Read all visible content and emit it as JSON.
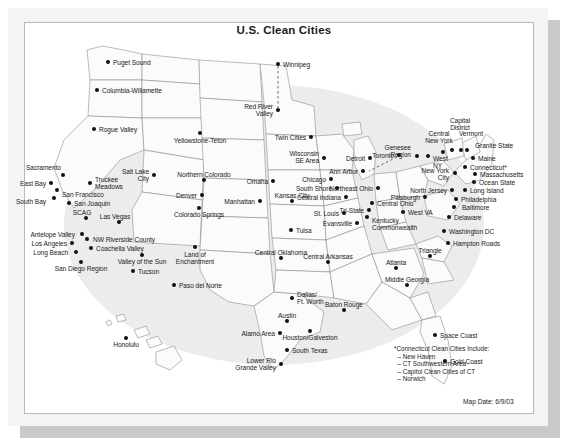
{
  "page": {
    "title": "U.S. Clean Cities",
    "map_date": "Map Date: 6/9/03",
    "footnote": "*Connecticut Clean Cities Include:\n  – New Haven\n  – CT Southwestern Area\n  – Capitol Clean Cities of CT\n  – Norwich",
    "colors": {
      "ink": "#1a1a1a",
      "marker": "#111111",
      "state_fill": "#fbfbfb",
      "state_stroke": "#8d8d8d",
      "halo": "#ececec",
      "frame": "#f4f4f4",
      "frame_shadow": "#c9c9c9"
    }
  },
  "map": {
    "type": "point-map",
    "region": "United States (lower 48 + Hawaii) with Canadian cities",
    "marker_shape": "filled-circle",
    "connector_style": "dashed-line",
    "cities": [
      {
        "name": "Puget Sound",
        "x": 84,
        "y": 22,
        "dx": 5,
        "dy": -3,
        "align": "left"
      },
      {
        "name": "Columbia-Willamette",
        "x": 73,
        "y": 50,
        "dx": 5,
        "dy": -3,
        "align": "left"
      },
      {
        "name": "Rogue Valley",
        "x": 70,
        "y": 89,
        "dx": 5,
        "dy": -3,
        "align": "left"
      },
      {
        "name": "Winnipeg",
        "x": 254,
        "y": 24,
        "dx": 5,
        "dy": -3,
        "align": "left"
      },
      {
        "name": "Red River\nValley",
        "x": 254,
        "y": 70,
        "dx": -5,
        "dy": -7,
        "align": "right"
      },
      {
        "name": "Yellowstone-Teton",
        "x": 176,
        "y": 93,
        "dx": 0,
        "dy": 4,
        "align": "center"
      },
      {
        "name": "Twin Citie s",
        "x": 287,
        "y": 97,
        "dx": -5,
        "dy": -3,
        "align": "right",
        "label": "Twin Cities"
      },
      {
        "name": "Sacramento",
        "x": 39,
        "y": 135,
        "dx": -2,
        "dy": -11,
        "align": "right"
      },
      {
        "name": "East Bay",
        "x": 27,
        "y": 143,
        "dx": -5,
        "dy": -3,
        "align": "right"
      },
      {
        "name": "San Francisco",
        "x": 33,
        "y": 150,
        "dx": 5,
        "dy": 1,
        "align": "left"
      },
      {
        "name": "South Bay",
        "x": 30,
        "y": 158,
        "dx": -8,
        "dy": 0,
        "align": "right"
      },
      {
        "name": "San Joaquin",
        "x": 45,
        "y": 163,
        "dx": 5,
        "dy": -3,
        "align": "left"
      },
      {
        "name": "Truckee\nMeadows",
        "x": 66,
        "y": 143,
        "dx": 5,
        "dy": -7,
        "align": "left"
      },
      {
        "name": "Salt Lake\nCity",
        "x": 130,
        "y": 135,
        "dx": -5,
        "dy": -7,
        "align": "right"
      },
      {
        "name": "Northern Colorado",
        "x": 180,
        "y": 140,
        "dx": 0,
        "dy": -9,
        "align": "center"
      },
      {
        "name": "Denver",
        "x": 178,
        "y": 155,
        "dx": -5,
        "dy": -3,
        "align": "right"
      },
      {
        "name": "Colorado Springs",
        "x": 175,
        "y": 168,
        "dx": 0,
        "dy": 3,
        "align": "center"
      },
      {
        "name": "SCAG",
        "x": 62,
        "y": 178,
        "dx": -4,
        "dy": -9,
        "align": "center"
      },
      {
        "name": "Las Vegas",
        "x": 95,
        "y": 182,
        "dx": -4,
        "dy": -9,
        "align": "center"
      },
      {
        "name": "Antelope Valley",
        "x": 58,
        "y": 194,
        "dx": -7,
        "dy": -3,
        "align": "right"
      },
      {
        "name": "Los Angeles",
        "x": 48,
        "y": 203,
        "dx": -5,
        "dy": -3,
        "align": "right"
      },
      {
        "name": "NW Riverside County",
        "x": 63,
        "y": 199,
        "dx": 6,
        "dy": -3,
        "align": "left"
      },
      {
        "name": "Coachella Valley",
        "x": 67,
        "y": 208,
        "dx": 5,
        "dy": -3,
        "align": "left"
      },
      {
        "name": "Long Beach",
        "x": 52,
        "y": 212,
        "dx": -8,
        "dy": -3,
        "align": "right"
      },
      {
        "name": "San Diego Region",
        "x": 57,
        "y": 222,
        "dx": 0,
        "dy": 3,
        "align": "center"
      },
      {
        "name": "Valley of the Sun",
        "x": 118,
        "y": 215,
        "dx": 0,
        "dy": 3,
        "align": "center"
      },
      {
        "name": "Tucson",
        "x": 109,
        "y": 231,
        "dx": 5,
        "dy": -3,
        "align": "left"
      },
      {
        "name": "Land of\nEnchantment",
        "x": 171,
        "y": 207,
        "dx": 0,
        "dy": 4,
        "align": "center"
      },
      {
        "name": "Paso del Norte",
        "x": 150,
        "y": 245,
        "dx": 5,
        "dy": -3,
        "align": "left"
      },
      {
        "name": "Omaha",
        "x": 249,
        "y": 141,
        "dx": -5,
        "dy": -3,
        "align": "right"
      },
      {
        "name": "Manhattan",
        "x": 236,
        "y": 161,
        "dx": -5,
        "dy": -3,
        "align": "right"
      },
      {
        "name": "Kansas City",
        "x": 268,
        "y": 161,
        "dx": 0,
        "dy": -9,
        "align": "center"
      },
      {
        "name": "St. Louis",
        "x": 320,
        "y": 173,
        "dx": -5,
        "dy": -3,
        "align": "right"
      },
      {
        "name": "Tulsa",
        "x": 267,
        "y": 190,
        "dx": 5,
        "dy": -3,
        "align": "left"
      },
      {
        "name": "Central Oklahoma",
        "x": 257,
        "y": 218,
        "dx": 0,
        "dy": -9,
        "align": "center"
      },
      {
        "name": "Central Arkansas",
        "x": 304,
        "y": 222,
        "dx": 0,
        "dy": -9,
        "align": "center"
      },
      {
        "name": "Wisconsin\nSE Area",
        "x": 300,
        "y": 118,
        "dx": -5,
        "dy": -8,
        "align": "right"
      },
      {
        "name": "Chicago",
        "x": 307,
        "y": 139,
        "dx": -5,
        "dy": -3,
        "align": "right"
      },
      {
        "name": "South Shore",
        "x": 313,
        "y": 148,
        "dx": -5,
        "dy": -3,
        "align": "right"
      },
      {
        "name": "Central Indiana",
        "x": 322,
        "y": 157,
        "dx": -5,
        "dy": -3,
        "align": "right"
      },
      {
        "name": "Ann Arbor",
        "x": 339,
        "y": 131,
        "dx": -5,
        "dy": -3,
        "align": "right"
      },
      {
        "name": "Detroit",
        "x": 346,
        "y": 118,
        "dx": -5,
        "dy": -3,
        "align": "right"
      },
      {
        "name": "Toronto",
        "x": 375,
        "y": 115,
        "dx": -5,
        "dy": -3,
        "align": "right"
      },
      {
        "name": "Northeast Ohio",
        "x": 354,
        "y": 148,
        "dx": -5,
        "dy": -3,
        "align": "right"
      },
      {
        "name": "Central Ohio",
        "x": 348,
        "y": 163,
        "dx": 5,
        "dy": -3,
        "align": "left"
      },
      {
        "name": "Tri-State",
        "x": 345,
        "y": 170,
        "dx": -5,
        "dy": -3,
        "align": "right"
      },
      {
        "name": "Evansville",
        "x": 333,
        "y": 183,
        "dx": -5,
        "dy": -3,
        "align": "right"
      },
      {
        "name": "Kentucky\nCommonwealth",
        "x": 343,
        "y": 177,
        "dx": 5,
        "dy": 0,
        "align": "left"
      },
      {
        "name": "West VA",
        "x": 379,
        "y": 172,
        "dx": 5,
        "dy": -3,
        "align": "left"
      },
      {
        "name": "Genesee\nRegion",
        "x": 393,
        "y": 116,
        "dx": -6,
        "dy": -12,
        "align": "right"
      },
      {
        "name": "West\nNY",
        "x": 404,
        "y": 116,
        "dx": 5,
        "dy": -1,
        "align": "left"
      },
      {
        "name": "Central\nNew York",
        "x": 419,
        "y": 112,
        "dx": -4,
        "dy": -22,
        "align": "center"
      },
      {
        "name": "Capital\nDistrict",
        "x": 428,
        "y": 110,
        "dx": 8,
        "dy": -33,
        "align": "center"
      },
      {
        "name": "Vermont",
        "x": 437,
        "y": 110,
        "dx": 10,
        "dy": -20,
        "align": "center"
      },
      {
        "name": "Granite State",
        "x": 443,
        "y": 110,
        "dx": 8,
        "dy": -8,
        "align": "left"
      },
      {
        "name": "Maine",
        "x": 449,
        "y": 118,
        "dx": 5,
        "dy": -3,
        "align": "left"
      },
      {
        "name": "Connecticut*",
        "x": 441,
        "y": 127,
        "dx": 5,
        "dy": -3,
        "align": "left"
      },
      {
        "name": "New York\nCity",
        "x": 431,
        "y": 133,
        "dx": -6,
        "dy": -6,
        "align": "right"
      },
      {
        "name": "Massachusetts",
        "x": 451,
        "y": 134,
        "dx": 5,
        "dy": -3,
        "align": "left"
      },
      {
        "name": "Ocean State",
        "x": 450,
        "y": 142,
        "dx": 5,
        "dy": -3,
        "align": "left"
      },
      {
        "name": "North Jersey",
        "x": 428,
        "y": 150,
        "dx": -5,
        "dy": -3,
        "align": "right"
      },
      {
        "name": "Long Island",
        "x": 441,
        "y": 150,
        "dx": 5,
        "dy": -3,
        "align": "left"
      },
      {
        "name": "Philadelphia",
        "x": 432,
        "y": 159,
        "dx": 5,
        "dy": -3,
        "align": "left"
      },
      {
        "name": "Pittsburgh",
        "x": 401,
        "y": 157,
        "dx": -5,
        "dy": -3,
        "align": "right"
      },
      {
        "name": "Baltimore",
        "x": 430,
        "y": 167,
        "dx": 8,
        "dy": -3,
        "align": "left"
      },
      {
        "name": "Delaware",
        "x": 425,
        "y": 177,
        "dx": 5,
        "dy": -3,
        "align": "left"
      },
      {
        "name": "Washington DC",
        "x": 420,
        "y": 191,
        "dx": 5,
        "dy": -3,
        "align": "left"
      },
      {
        "name": "Hampton Roads",
        "x": 424,
        "y": 203,
        "dx": 5,
        "dy": -3,
        "align": "left"
      },
      {
        "name": "Triangle",
        "x": 406,
        "y": 216,
        "dx": 0,
        "dy": -9,
        "align": "center"
      },
      {
        "name": "Atlanta",
        "x": 372,
        "y": 228,
        "dx": 0,
        "dy": -9,
        "align": "center"
      },
      {
        "name": "Middle Georgia",
        "x": 383,
        "y": 245,
        "dx": 0,
        "dy": -9,
        "align": "center"
      },
      {
        "name": "Space Coast",
        "x": 411,
        "y": 295,
        "dx": 5,
        "dy": -3,
        "align": "left"
      },
      {
        "name": "Gold Coast",
        "x": 421,
        "y": 321,
        "dx": 5,
        "dy": -3,
        "align": "left"
      },
      {
        "name": "Dallas/\nFt. Worth",
        "x": 268,
        "y": 258,
        "dx": 5,
        "dy": -7,
        "align": "left"
      },
      {
        "name": "Austin",
        "x": 263,
        "y": 281,
        "dx": 0,
        "dy": -9,
        "align": "center"
      },
      {
        "name": "Baton Rouge",
        "x": 320,
        "y": 270,
        "dx": 0,
        "dy": -9,
        "align": "center"
      },
      {
        "name": "Houston/Galveston",
        "x": 286,
        "y": 291,
        "dx": 0,
        "dy": 3,
        "align": "center"
      },
      {
        "name": "Alamo Area",
        "x": 256,
        "y": 293,
        "dx": -5,
        "dy": -3,
        "align": "right"
      },
      {
        "name": "South Texas",
        "x": 263,
        "y": 310,
        "dx": 5,
        "dy": -3,
        "align": "left"
      },
      {
        "name": "Lower Rio\nGrande Valley",
        "x": 257,
        "y": 324,
        "dx": -5,
        "dy": -7,
        "align": "right"
      },
      {
        "name": "Honolulu",
        "x": 102,
        "y": 298,
        "dx": 0,
        "dy": 3,
        "align": "center"
      }
    ],
    "connectors": [
      {
        "from": "Winnipeg",
        "to": "Red River Valley"
      },
      {
        "from": "Toronto",
        "to": "Detroit"
      }
    ]
  }
}
